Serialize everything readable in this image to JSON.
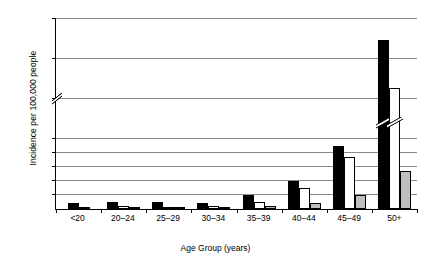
{
  "chart_data": {
    "type": "bar",
    "title": "",
    "xlabel": "Age Group (years)",
    "ylabel": "Incidence per 100,000 people",
    "categories": [
      "<20",
      "20–24",
      "25–29",
      "30–34",
      "35–39",
      "40–44",
      "45–49",
      "50+"
    ],
    "series": [
      {
        "name": "series-1-black",
        "color": "#000000",
        "values": [
          4,
          5,
          5,
          4,
          10,
          20,
          45,
          112
        ]
      },
      {
        "name": "series-2-white",
        "color": "#ffffff",
        "values": [
          1,
          2,
          1,
          2,
          5,
          15,
          37,
          82
        ]
      },
      {
        "name": "series-3-grey",
        "color": "#bfbfbf",
        "values": [
          0,
          1,
          1,
          1,
          2,
          4,
          10,
          27
        ]
      }
    ],
    "ylim": [
      0,
      125
    ],
    "yticks": [
      10,
      20,
      30,
      40,
      50,
      75,
      100,
      125
    ],
    "ytick_labels": [
      "10",
      "20",
      "30",
      "40",
      "50",
      "75",
      "100",
      "125"
    ],
    "axis_break": {
      "between": [
        50,
        75
      ],
      "axis": "y"
    },
    "grid": true,
    "legend": "none",
    "broken_bars": [
      "series-1-black:50+",
      "series-2-white:50+"
    ]
  },
  "axis": {
    "y_title": "Incidence per 100,000 people",
    "x_title": "Age Group (years)"
  }
}
